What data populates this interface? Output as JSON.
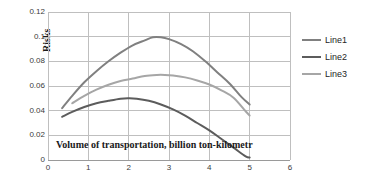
{
  "chart_data": {
    "type": "line",
    "title": "",
    "xlabel": "Volume of transportation, billion ton-kilometr",
    "ylabel": "Risks",
    "xlim": [
      0,
      6
    ],
    "ylim": [
      0,
      0.12
    ],
    "grid": true,
    "legend_position": "right",
    "x_ticks": [
      "0",
      "1",
      "2",
      "3",
      "4",
      "5",
      "6"
    ],
    "y_ticks": [
      "0",
      "0.02",
      "0.04",
      "0.06",
      "0.08",
      "0.1",
      "0.12"
    ],
    "series": [
      {
        "name": "Line1",
        "color": "#808080",
        "x": [
          0.35,
          0.6,
          0.9,
          1.2,
          1.5,
          1.8,
          2.1,
          2.4,
          2.6,
          2.8,
          3.0,
          3.3,
          3.6,
          3.9,
          4.2,
          4.5,
          4.8,
          5.0
        ],
        "values": [
          0.042,
          0.052,
          0.063,
          0.072,
          0.08,
          0.087,
          0.093,
          0.097,
          0.0995,
          0.0995,
          0.098,
          0.094,
          0.088,
          0.08,
          0.071,
          0.062,
          0.051,
          0.045
        ]
      },
      {
        "name": "Line2",
        "color": "#5c5c5c",
        "x": [
          0.35,
          0.6,
          0.9,
          1.2,
          1.5,
          1.8,
          2.0,
          2.2,
          2.5,
          2.8,
          3.1,
          3.4,
          3.7,
          4.0,
          4.3,
          4.6,
          4.9,
          5.0
        ],
        "values": [
          0.035,
          0.039,
          0.043,
          0.046,
          0.048,
          0.0497,
          0.05,
          0.0497,
          0.048,
          0.045,
          0.041,
          0.036,
          0.03,
          0.024,
          0.017,
          0.01,
          0.003,
          0.002
        ]
      },
      {
        "name": "Line3",
        "color": "#a6a6a6",
        "x": [
          0.6,
          0.9,
          1.2,
          1.5,
          1.8,
          2.1,
          2.4,
          2.7,
          2.9,
          3.1,
          3.4,
          3.7,
          4.0,
          4.3,
          4.6,
          4.9,
          5.0
        ],
        "values": [
          0.046,
          0.052,
          0.057,
          0.061,
          0.064,
          0.066,
          0.0682,
          0.069,
          0.069,
          0.0685,
          0.067,
          0.0645,
          0.0612,
          0.0565,
          0.0505,
          0.0395,
          0.036
        ]
      }
    ]
  },
  "legend": {
    "items": [
      {
        "label": "Line1"
      },
      {
        "label": "Line2"
      },
      {
        "label": "Line3"
      }
    ]
  },
  "axes": {
    "y_title": "Risks",
    "x_title": "Volume of transportation, billion ton-kilometr"
  }
}
